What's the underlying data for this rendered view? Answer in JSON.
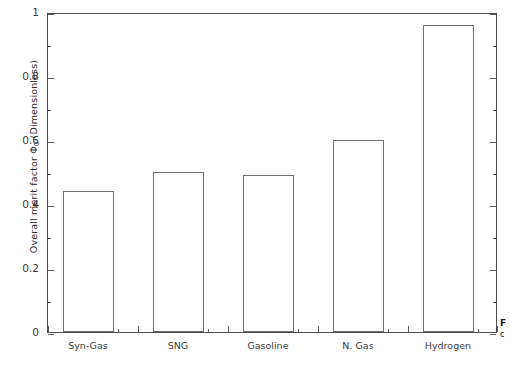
{
  "chart_data": {
    "type": "bar",
    "title": "",
    "subtitle": "",
    "xlabel": "",
    "ylabel": "Overall merit factor Φ₀ (Dimensionless)",
    "ylabel_text": "Overall merit factor",
    "ylabel_symbol": "Φ",
    "ylabel_symbol_sub": "0",
    "ylabel_units": "(Dimensionless)",
    "categories": [
      "Syn-Gas",
      "SNG",
      "Gasoline",
      "N. Gas",
      "Hydrogen"
    ],
    "values": [
      0.44,
      0.5,
      0.49,
      0.6,
      0.96
    ],
    "ylim": [
      0,
      1
    ],
    "xlim": [
      0,
      5
    ],
    "y_major_ticks": [
      0,
      0.2,
      0.4,
      0.6,
      0.8,
      1
    ],
    "y_major_tick_labels": [
      "0",
      "0.2",
      "0.4",
      "0.6",
      "0.8",
      "1"
    ],
    "y_minor_ticks": [
      0.1,
      0.3,
      0.5,
      0.7,
      0.9
    ],
    "grid": false,
    "legend": null,
    "legend_position": "none",
    "bar_fill_color": "#ffffff",
    "bar_edge_color": "#6e6e6e",
    "axis_color": "#4d4d4d",
    "text_color": "#3a3a3a",
    "background_color": "#ffffff",
    "annotations": []
  },
  "caption": {
    "line1": "F",
    "line2": "c"
  }
}
